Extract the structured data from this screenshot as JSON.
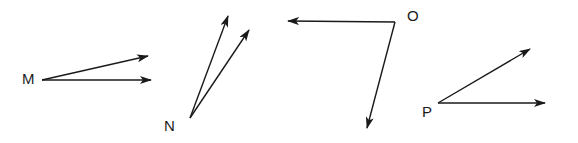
{
  "diagram": {
    "type": "angles",
    "angles": [
      {
        "label": "M",
        "label_pos": [
          30,
          84
        ],
        "vertex": [
          42,
          80
        ],
        "rays": [
          [
            148,
            56
          ],
          [
            151,
            80
          ]
        ]
      },
      {
        "label": "N",
        "label_pos": [
          164,
          131
        ],
        "vertex": [
          190,
          118
        ],
        "rays": [
          [
            228,
            16
          ],
          [
            249,
            30
          ]
        ]
      },
      {
        "label": "O",
        "label_pos": [
          407,
          21
        ],
        "vertex": [
          395,
          22
        ],
        "rays": [
          [
            288,
            21
          ],
          [
            367,
            128
          ]
        ]
      },
      {
        "label": "P",
        "label_pos": [
          422,
          117
        ],
        "vertex": [
          438,
          103
        ],
        "rays": [
          [
            530,
            49
          ],
          [
            545,
            103
          ]
        ]
      }
    ],
    "colors": {
      "stroke": "#1a1a1a",
      "background": "#ffffff"
    }
  }
}
